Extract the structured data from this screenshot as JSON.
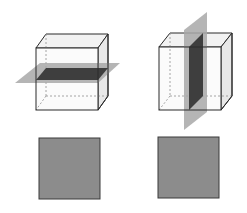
{
  "diagram": {
    "title": "",
    "colors": {
      "background": "#ffffff",
      "edge": "#2a2a2a",
      "hidden_edge": "#9a9a9a",
      "plane": "#a8a8a8",
      "cross_section": "#3e3e3e",
      "cube_top": "#f1f1f1",
      "cube_side": "#e6e6e6",
      "square_fill": "#8c8c8c",
      "square_border": "#3a3a3a"
    },
    "panels": [
      {
        "id": "horizontal-slice",
        "cube": {
          "front": [
            36,
            48,
            62,
            62
          ],
          "offset": [
            10,
            -14
          ]
        },
        "plane": {
          "orientation": "horizontal",
          "points": "15,83 40,63 120,63 98,83",
          "cross_section": "36,80 46,68 108,68 98,80"
        },
        "result_square": {
          "x": 39,
          "y": 138,
          "size": 61
        }
      },
      {
        "id": "vertical-slice",
        "cube": {
          "front": [
            159,
            47,
            62,
            63
          ],
          "offset": [
            11,
            -14
          ]
        },
        "plane": {
          "orientation": "vertical",
          "points": "184,30 207,12 207,112 184,130",
          "cross_section": "189,110 189,47 203,33 203,96"
        },
        "result_square": {
          "x": 158,
          "y": 137,
          "size": 61
        }
      }
    ]
  }
}
